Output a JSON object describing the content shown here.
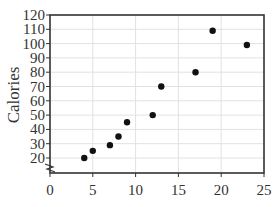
{
  "chart_data": {
    "type": "scatter",
    "title": "",
    "xlabel": "",
    "ylabel": "Calories",
    "xlim": [
      0,
      25
    ],
    "ylim": [
      10,
      120
    ],
    "x_ticks": [
      0,
      5,
      10,
      15,
      20,
      25
    ],
    "y_ticks": [
      20,
      30,
      40,
      50,
      60,
      70,
      80,
      90,
      100,
      110,
      120
    ],
    "y_axis_break": true,
    "grid": true,
    "legend": null,
    "series": [
      {
        "name": "Calories",
        "color": "#111111",
        "points": [
          {
            "x": 4,
            "y": 20
          },
          {
            "x": 5,
            "y": 25
          },
          {
            "x": 7,
            "y": 29
          },
          {
            "x": 8,
            "y": 35
          },
          {
            "x": 9,
            "y": 45
          },
          {
            "x": 12,
            "y": 50
          },
          {
            "x": 13,
            "y": 70
          },
          {
            "x": 17,
            "y": 80
          },
          {
            "x": 19,
            "y": 109
          },
          {
            "x": 23,
            "y": 99
          }
        ]
      }
    ]
  },
  "labels": {
    "ylabel": "Calories",
    "x_tick_labels": [
      "0",
      "5",
      "10",
      "15",
      "20",
      "25"
    ],
    "y_tick_labels": [
      "20",
      "30",
      "40",
      "50",
      "60",
      "70",
      "80",
      "90",
      "100",
      "110",
      "120"
    ]
  }
}
